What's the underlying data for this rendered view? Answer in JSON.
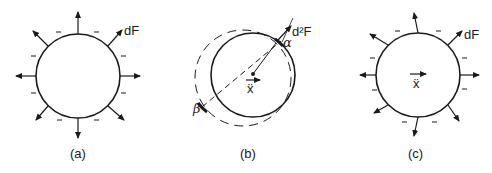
{
  "figure": {
    "panels": [
      {
        "id": "a",
        "caption": "(a)",
        "force_label": "dF",
        "description": "Uniform outward force distribution around circle; negative signs around boundary"
      },
      {
        "id": "b",
        "caption": "(b)",
        "force_label": "d²F",
        "point_alpha": "α",
        "point_beta": "β",
        "acceleration_label": "ẍ",
        "description": "Solid circle with displaced dashed circle; dashed line from beta through center to alpha"
      },
      {
        "id": "c",
        "caption": "(c)",
        "force_label": "dF",
        "acceleration_label": "ẍ",
        "description": "Non-uniform outward force distribution with acceleration arrow at center"
      }
    ],
    "sign_symbol": "–",
    "colors": {
      "ink": "#1a1a1a",
      "background": "#ffffff"
    }
  }
}
